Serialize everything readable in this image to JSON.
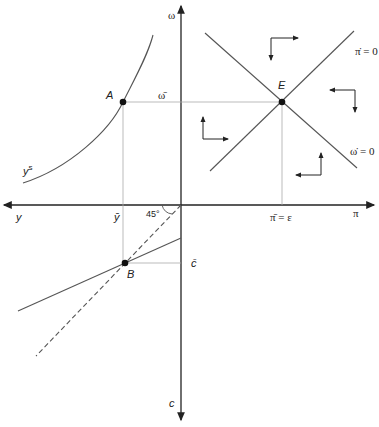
{
  "diagram": {
    "axes": {
      "top": "ω",
      "bottom": "c",
      "left": "y",
      "right": "π"
    },
    "points": {
      "A": "A",
      "B": "B",
      "E": "E"
    },
    "labels": {
      "omega_bar": "ω̄",
      "y_bar": "ȳ",
      "c_bar": "c̄",
      "pi_bar": "π̄ = ε",
      "angle": "45°",
      "ys": "y",
      "ys_sup": "s",
      "pi_dot": "π̇ = 0",
      "omega_dot": "ω̇ = 0"
    },
    "colors": {
      "line": "#555555",
      "guide": "#aaaaaa",
      "axis": "#222222"
    }
  }
}
